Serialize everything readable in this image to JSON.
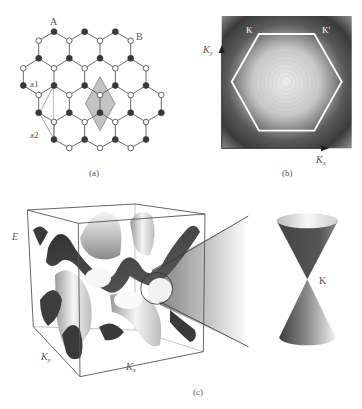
{
  "figure": {
    "panels": [
      {
        "id": "a",
        "caption": "(a)",
        "title": "Graphene honeycomb lattice",
        "sublattice_labels": {
          "A": "A",
          "B": "B"
        },
        "vector_labels": {
          "a1": "a1",
          "a2": "a2"
        },
        "legend": {
          "filled_atom": "A sublattice",
          "open_atom": "B sublattice"
        },
        "unit_cell": "shaded rhombus",
        "colors": {
          "bond": "#6a6a6a",
          "filled_atom": "#3a3a3a",
          "open_atom_fill": "#ffffff",
          "unit_cell": "#bdbdbd"
        }
      },
      {
        "id": "b",
        "caption": "(b)",
        "title": "First Brillouin zone",
        "axis_x": {
          "base": "K",
          "sub": "x"
        },
        "axis_y": {
          "base": "K",
          "sub": "y"
        },
        "corner_labels": {
          "K": "K",
          "K_prime": "K'"
        },
        "colors": {
          "hexagon": "#ffffff",
          "center": "#e8e8e8",
          "edge": "#3c3c3c"
        }
      },
      {
        "id": "c",
        "caption": "(c)",
        "title": "Band structure and Dirac cone",
        "axis_e": "E",
        "axis_x": {
          "base": "K",
          "sub": "x"
        },
        "axis_y": {
          "base": "K",
          "sub": "y"
        },
        "cone_label": "K",
        "colors": {
          "band_dark": "#3a3a3a",
          "band_light": "#f2f2f2",
          "box": "#555555"
        }
      }
    ]
  }
}
